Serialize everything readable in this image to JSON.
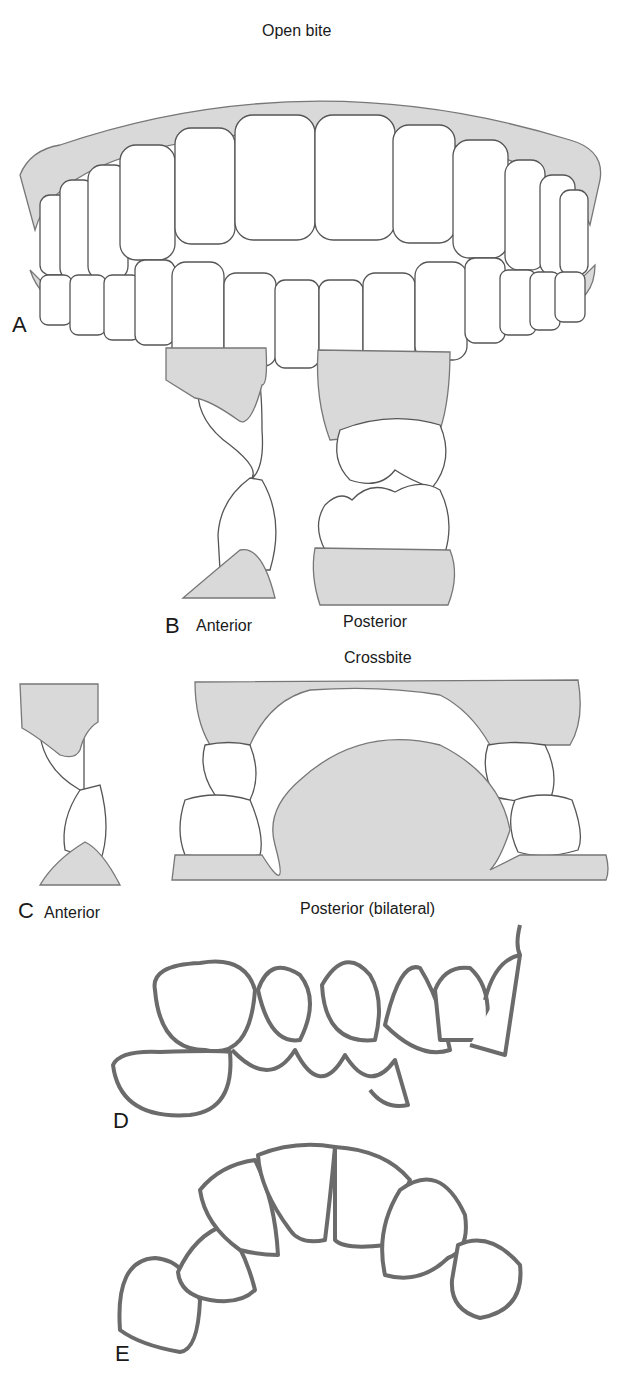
{
  "figure": {
    "title": "Open bite",
    "panels": [
      {
        "letter": "A",
        "caption": ""
      },
      {
        "letter": "B",
        "caption": "Anterior"
      },
      {
        "letter": "",
        "caption": "Posterior"
      },
      {
        "letter": "",
        "caption": "Crossbite"
      },
      {
        "letter": "C",
        "caption": "Anterior"
      },
      {
        "letter": "",
        "caption": "Posterior (bilateral)"
      },
      {
        "letter": "D",
        "caption": ""
      },
      {
        "letter": "E",
        "caption": ""
      }
    ]
  },
  "colors": {
    "gum_fill": "#d9d9d9",
    "outline": "#555555",
    "thick_outline": "#6b6b6b",
    "background": "#ffffff"
  }
}
